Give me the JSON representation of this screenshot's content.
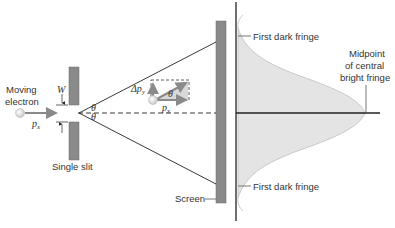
{
  "diagram": {
    "labels": {
      "moving_electron_line1": "Moving",
      "moving_electron_line2": "electron",
      "slit_width": "W",
      "momentum_x_left": "p",
      "momentum_x_left_sub": "x",
      "theta_upper": "θ",
      "theta_lower": "θ",
      "delta_py": "Δp",
      "delta_py_sub": "y",
      "theta_vector": "θ",
      "momentum_x_right": "p",
      "momentum_x_right_sub": "x",
      "single_slit": "Single slit",
      "screen": "Screen",
      "first_dark_fringe_top": "First dark fringe",
      "first_dark_fringe_bottom": "First dark fringe",
      "midpoint_line1": "Midpoint",
      "midpoint_line2": "of central",
      "midpoint_line3": "bright fringe"
    },
    "colors": {
      "slit_bar": "#8a8a8a",
      "screen_bar": "#8a8a8a",
      "intensity_fill": "#e4e4e4",
      "intensity_stroke": "#c8c8c8",
      "arrow": "#8a8a8a",
      "lines": "#222222",
      "electron": "#dcdcdc"
    }
  }
}
